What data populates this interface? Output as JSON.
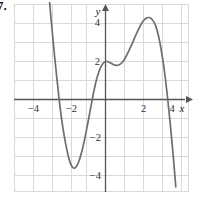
{
  "figure": {
    "problem_number": "7.",
    "background_color": "#ffffff",
    "width": 200,
    "height": 199
  },
  "chart_data": {
    "type": "line",
    "title": "",
    "subtitle": "",
    "xlabel": "x",
    "ylabel": "y",
    "xlim": [
      -4.7,
      4.3
    ],
    "ylim": [
      -5.0,
      5.0
    ],
    "grid": true,
    "grid_step": 1,
    "grid_color": "#d9d9d9",
    "axis_color": "#555555",
    "curve_color": "#6e6e6e",
    "legend": "none",
    "x_ticks": [
      -4,
      -2,
      2,
      4
    ],
    "x_tick_labels": [
      "−4",
      "−2",
      "2",
      "4"
    ],
    "y_ticks": [
      4,
      2,
      -2,
      -4
    ],
    "y_tick_labels": [
      "4",
      "2",
      "−2",
      "−4"
    ],
    "axis_arrows": [
      "+x",
      "+y"
    ],
    "series": [
      {
        "name": "polynomial",
        "points": [
          [
            -2.94,
            5.1
          ],
          [
            -2.85,
            4.1
          ],
          [
            -2.75,
            3.0
          ],
          [
            -2.6,
            1.5
          ],
          [
            -2.45,
            0.1
          ],
          [
            -2.3,
            -1.1
          ],
          [
            -2.15,
            -2.05
          ],
          [
            -2.0,
            -2.8
          ],
          [
            -1.85,
            -3.35
          ],
          [
            -1.7,
            -3.6
          ],
          [
            -1.55,
            -3.55
          ],
          [
            -1.4,
            -3.25
          ],
          [
            -1.25,
            -2.75
          ],
          [
            -1.1,
            -2.1
          ],
          [
            -0.95,
            -1.35
          ],
          [
            -0.8,
            -0.55
          ],
          [
            -0.65,
            0.25
          ],
          [
            -0.5,
            0.95
          ],
          [
            -0.35,
            1.45
          ],
          [
            -0.2,
            1.8
          ],
          [
            -0.05,
            1.98
          ],
          [
            0.1,
            2.0
          ],
          [
            0.25,
            1.93
          ],
          [
            0.4,
            1.85
          ],
          [
            0.55,
            1.8
          ],
          [
            0.7,
            1.82
          ],
          [
            0.85,
            1.92
          ],
          [
            1.0,
            2.12
          ],
          [
            1.15,
            2.4
          ],
          [
            1.3,
            2.72
          ],
          [
            1.45,
            3.05
          ],
          [
            1.6,
            3.4
          ],
          [
            1.75,
            3.72
          ],
          [
            1.9,
            4.0
          ],
          [
            2.05,
            4.2
          ],
          [
            2.2,
            4.3
          ],
          [
            2.35,
            4.3
          ],
          [
            2.5,
            4.15
          ],
          [
            2.65,
            3.85
          ],
          [
            2.8,
            3.3
          ],
          [
            2.95,
            2.5
          ],
          [
            3.1,
            1.5
          ],
          [
            3.25,
            0.25
          ],
          [
            3.4,
            -1.2
          ],
          [
            3.55,
            -2.8
          ],
          [
            3.7,
            -4.6
          ]
        ],
        "local_minimum": [
          -1.7,
          -3.6
        ],
        "local_maximum": [
          2.3,
          4.3
        ],
        "saddle_region": [
          0.1,
          2.0
        ],
        "x_intercepts": [
          -3.2,
          -0.7,
          3.3
        ],
        "y_intercept": 2.0
      }
    ]
  }
}
